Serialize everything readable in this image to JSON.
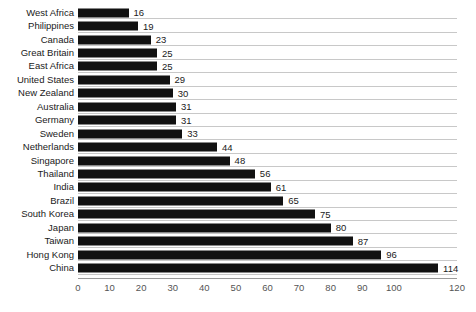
{
  "chart_data": {
    "type": "bar",
    "orientation": "horizontal",
    "title": "",
    "subtitle": "",
    "xlabel": "",
    "ylabel": "",
    "xlim": [
      0,
      120
    ],
    "xticks": [
      0,
      10,
      20,
      30,
      40,
      50,
      60,
      70,
      80,
      90,
      100,
      110,
      120
    ],
    "xtick_labels": [
      "0",
      "10",
      "20",
      "30",
      "40",
      "50",
      "60",
      "70",
      "80",
      "90",
      "100",
      "110",
      "120"
    ],
    "visible_xtick_labels": [
      "0",
      "10",
      "20",
      "30",
      "40",
      "50",
      "60",
      "70",
      "80",
      "90",
      "100",
      "120"
    ],
    "grid": "horizontal",
    "legend": "none",
    "data_labels": true,
    "bar_color": "#111111",
    "gridline_color": "#c8c8c8",
    "axis_color": "#9a9a9a",
    "text_color": "#1a1a1a",
    "tick_text_color": "#555555",
    "categories": [
      "West Africa",
      "Philippines",
      "Canada",
      "Great Britain",
      "East Africa",
      "United States",
      "New Zealand",
      "Australia",
      "Germany",
      "Sweden",
      "Netherlands",
      "Singapore",
      "Thailand",
      "India",
      "Brazil",
      "South Korea",
      "Japan",
      "Taiwan",
      "Hong Kong",
      "China"
    ],
    "values": [
      16,
      19,
      23,
      25,
      25,
      29,
      30,
      31,
      31,
      33,
      44,
      48,
      56,
      61,
      65,
      75,
      80,
      87,
      96,
      114
    ],
    "value_labels": [
      "16",
      "19",
      "23",
      "25",
      "25",
      "29",
      "30",
      "31",
      "31",
      "33",
      "44",
      "48",
      "56",
      "61",
      "65",
      "75",
      "80",
      "87",
      "96",
      "114"
    ]
  }
}
